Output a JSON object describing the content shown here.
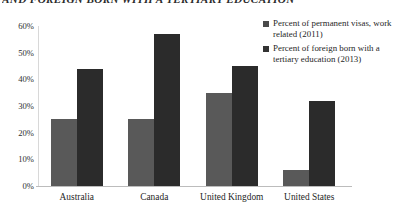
{
  "chart_data": {
    "type": "bar",
    "title": "AND FOREIGN BORN WITH A TERTIARY EDUCATION",
    "xlabel": "",
    "ylabel": "",
    "ylim": [
      0,
      60
    ],
    "yticks": [
      "0%",
      "10%",
      "20%",
      "30%",
      "40%",
      "50%",
      "60%"
    ],
    "ytick_values": [
      0,
      10,
      20,
      30,
      40,
      50,
      60
    ],
    "grid": false,
    "legend_position": "right",
    "categories": [
      "Australia",
      "Canada",
      "United Kingdom",
      "United States"
    ],
    "series": [
      {
        "name": "Percent of permanent visas, work related (2011)",
        "color": "#595959",
        "values": [
          25,
          25,
          35,
          6
        ]
      },
      {
        "name": "Percent of foreign born with a tertiary education (2013)",
        "color": "#2b2b2b",
        "values": [
          44,
          57,
          45,
          32
        ]
      }
    ]
  },
  "legend": {
    "items": [
      {
        "label": "Percent of permanent visas, work related (2011)"
      },
      {
        "label": "Percent of foreign born with a tertiary education (2013)"
      }
    ]
  }
}
